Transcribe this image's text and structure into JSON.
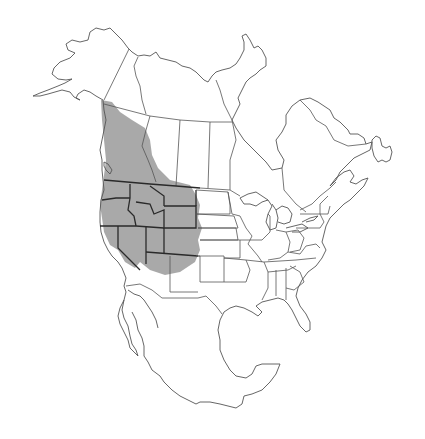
{
  "map": {
    "region": "North America",
    "type": "species range map",
    "colors": {
      "background": "#ffffff",
      "outline": "#555555",
      "range_fill": "#9a9a9a",
      "range_borders": "#2a2a2a"
    },
    "range": {
      "description": "Western North America: southern Yukon, British Columbia, western Alberta, Washington, Oregon, Idaho, Montana, Wyoming, Nevada, Utah, Colorado, northern California, northern Arizona",
      "regions_shaded": [
        "Yukon (south)",
        "British Columbia",
        "Alberta (west)",
        "Washington",
        "Oregon",
        "Idaho",
        "Montana",
        "Wyoming",
        "California (north/interior)",
        "Nevada",
        "Utah",
        "Colorado",
        "Arizona (north)",
        "New Mexico (northwest)",
        "South Dakota (west)",
        "Nebraska (west)"
      ]
    }
  }
}
